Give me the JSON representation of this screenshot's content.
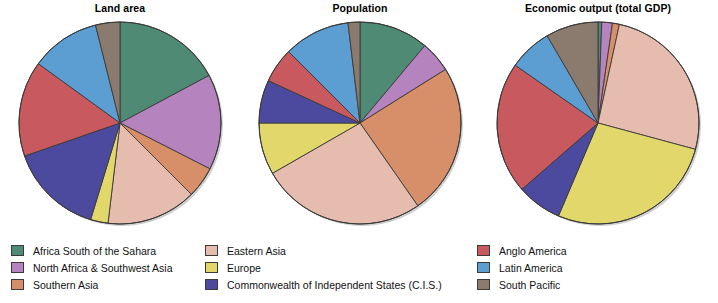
{
  "figure": {
    "background": "#ffffff",
    "outline_color": "#3a3a3a"
  },
  "categories": [
    {
      "key": "africa_south_sahara",
      "label": "Africa South of the Sahara",
      "color": "#4e8a74"
    },
    {
      "key": "north_africa_sw_asia",
      "label": "North Africa & Southwest Asia",
      "color": "#b583bd"
    },
    {
      "key": "southern_asia",
      "label": "Southern Asia",
      "color": "#d68f68"
    },
    {
      "key": "eastern_asia",
      "label": "Eastern Asia",
      "color": "#e5bcae"
    },
    {
      "key": "europe",
      "label": "Europe",
      "color": "#e2d76b"
    },
    {
      "key": "cis",
      "label": "Commonwealth of Independent States (C.I.S.)",
      "color": "#4c4a9e"
    },
    {
      "key": "anglo_america",
      "label": "Anglo America",
      "color": "#c8595f"
    },
    {
      "key": "latin_america",
      "label": "Latin America",
      "color": "#5d9ed2"
    },
    {
      "key": "south_pacific",
      "label": "South Pacific",
      "color": "#8b7a6e"
    }
  ],
  "legend": {
    "columns": [
      {
        "items": [
          "africa_south_sahara",
          "north_africa_sw_asia",
          "southern_asia"
        ]
      },
      {
        "items": [
          "eastern_asia",
          "europe",
          "cis"
        ]
      },
      {
        "items": [
          "anglo_america",
          "latin_america",
          "south_pacific"
        ]
      }
    ],
    "labels": {
      "africa_south_sahara": "Africa South of the Sahara",
      "north_africa_sw_asia": "North Africa & Southwest Asia",
      "southern_asia": "Southern Asia",
      "eastern_asia": "Eastern Asia",
      "europe": "Europe",
      "cis": "Commonwealth of Independent States (C.I.S.)",
      "anglo_america": "Anglo America",
      "latin_america": "Latin America",
      "south_pacific": "South Pacific"
    }
  },
  "chart_data": [
    {
      "type": "pie",
      "title": "Land area",
      "xlabel": "",
      "ylabel": "",
      "legend_position": "bottom",
      "start_angle_deg": 0,
      "direction": "clockwise",
      "categories": [
        "Africa South of the Sahara",
        "North Africa & Southwest Asia",
        "Southern Asia",
        "Eastern Asia",
        "Europe",
        "Commonwealth of Independent States (C.I.S.)",
        "Anglo America",
        "Latin America",
        "South Pacific"
      ],
      "values": [
        17.2,
        15.3,
        5.0,
        14.4,
        2.8,
        15.0,
        15.3,
        11.1,
        3.9
      ],
      "unit": "percent"
    },
    {
      "type": "pie",
      "title": "Population",
      "xlabel": "",
      "ylabel": "",
      "legend_position": "bottom",
      "start_angle_deg": 0,
      "direction": "clockwise",
      "categories": [
        "Africa South of the Sahara",
        "North Africa & Southwest Asia",
        "Southern Asia",
        "Eastern Asia",
        "Europe",
        "Commonwealth of Independent States (C.I.S.)",
        "Anglo America",
        "Latin America",
        "South Pacific"
      ],
      "values": [
        11.1,
        5.0,
        24.2,
        26.4,
        8.3,
        6.9,
        5.6,
        10.6,
        1.9
      ],
      "unit": "percent"
    },
    {
      "type": "pie",
      "title": "Economic output (total GDP)",
      "xlabel": "",
      "ylabel": "",
      "legend_position": "bottom",
      "start_angle_deg": 0,
      "direction": "clockwise",
      "categories": [
        "Africa South of the Sahara",
        "North Africa & Southwest Asia",
        "Southern Asia",
        "Eastern Asia",
        "Europe",
        "Commonwealth of Independent States (C.I.S.)",
        "Anglo America",
        "Latin America",
        "South Pacific"
      ],
      "values": [
        0.6,
        1.7,
        1.1,
        25.8,
        27.2,
        7.2,
        21.1,
        6.9,
        8.4
      ],
      "unit": "percent"
    }
  ]
}
